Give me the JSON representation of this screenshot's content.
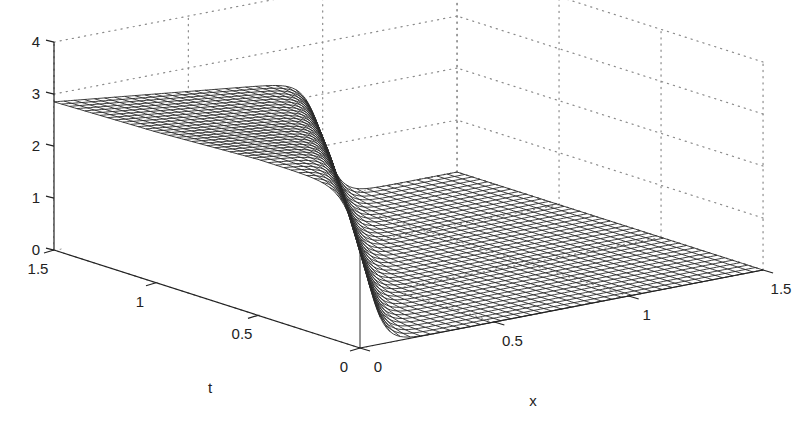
{
  "chart_data": {
    "type": "surface",
    "title": "",
    "xlabel": "x",
    "ylabel": "t",
    "zlabel": "",
    "x_range": [
      0,
      1.5
    ],
    "t_range": [
      0,
      1.5
    ],
    "z_range": [
      0,
      4
    ],
    "x_ticks": [
      "0",
      "0.5",
      "1",
      "1.5"
    ],
    "t_ticks": [
      "0",
      "0.5",
      "1",
      "1.5"
    ],
    "z_ticks": [
      "0",
      "1",
      "2",
      "3",
      "4"
    ],
    "grid": true,
    "grid_style": "dotted",
    "surface": {
      "description": "Wireframe mesh surface u(x,t): plateau of height ~3 near x=0 that decreases linearly in x, ending in a steep shock front that drops to 0; region beyond the shock is flat at 0.",
      "plateau_height_at_x0": 3,
      "shock_position": [
        {
          "t": 0.0,
          "x": 0.02
        },
        {
          "t": 0.5,
          "x": 0.35
        },
        {
          "t": 1.0,
          "x": 0.68
        },
        {
          "t": 1.5,
          "x": 1.0
        }
      ],
      "height_before_shock": [
        {
          "t": 0.0,
          "z": 3.0
        },
        {
          "t": 0.5,
          "z": 3.0
        },
        {
          "t": 1.0,
          "z": 2.9
        },
        {
          "t": 1.5,
          "z": 2.85
        }
      ],
      "height_after_shock": 0,
      "mesh_lines_x": 40,
      "mesh_lines_t": 40,
      "line_color": "#2a2a2a"
    }
  },
  "axes": {
    "x_label": "x",
    "t_label": "t"
  }
}
